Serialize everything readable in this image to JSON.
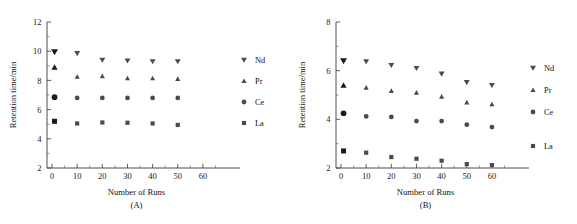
{
  "figure": {
    "background": "#ffffff",
    "marker_color": "#4b4b4b",
    "axis_color": "#3a3a3a"
  },
  "chart_data": [
    {
      "type": "scatter",
      "panel_label": "(A)",
      "title": "",
      "xlabel": "Number of Runs",
      "ylabel": "Retention time/min",
      "xlim": [
        -2,
        66
      ],
      "ylim": [
        2,
        12
      ],
      "xticks": [
        0,
        10,
        20,
        30,
        40,
        50,
        60
      ],
      "yticks": [
        2,
        4,
        6,
        8,
        10,
        12
      ],
      "xtick_labels": [
        "0",
        "10",
        "20",
        "30",
        "40",
        "50",
        "60"
      ],
      "ytick_labels": [
        "2",
        "4",
        "6",
        "8",
        "10",
        "12"
      ],
      "grid": false,
      "legend_position": "right",
      "x": [
        1,
        10,
        20,
        30,
        40,
        50
      ],
      "series": [
        {
          "name": "Nd",
          "marker": "triangle-down",
          "values": [
            9.95,
            9.85,
            9.4,
            9.35,
            9.3,
            9.3
          ]
        },
        {
          "name": "Pr",
          "marker": "triangle-up",
          "values": [
            8.9,
            8.25,
            8.3,
            8.15,
            8.15,
            8.1
          ]
        },
        {
          "name": "Ce",
          "marker": "circle",
          "values": [
            6.85,
            6.8,
            6.8,
            6.8,
            6.8,
            6.8
          ]
        },
        {
          "name": "La",
          "marker": "square",
          "values": [
            5.2,
            5.05,
            5.12,
            5.1,
            5.05,
            4.95
          ]
        }
      ]
    },
    {
      "type": "scatter",
      "panel_label": "(B)",
      "title": "",
      "xlabel": "Number of Runs",
      "ylabel": "Retention time/min",
      "xlim": [
        -2,
        66
      ],
      "ylim": [
        2,
        8
      ],
      "xticks": [
        0,
        10,
        20,
        30,
        40,
        50,
        60
      ],
      "yticks": [
        2,
        4,
        6,
        8
      ],
      "xtick_labels": [
        "0",
        "10",
        "20",
        "30",
        "40",
        "50",
        "60"
      ],
      "ytick_labels": [
        "2",
        "4",
        "6",
        "8"
      ],
      "grid": false,
      "legend_position": "right",
      "x": [
        1,
        10,
        20,
        30,
        40,
        50,
        60
      ],
      "series": [
        {
          "name": "Nd",
          "marker": "triangle-down",
          "values": [
            6.4,
            6.37,
            6.22,
            6.1,
            5.87,
            5.52,
            5.4
          ]
        },
        {
          "name": "Pr",
          "marker": "triangle-up",
          "values": [
            5.4,
            5.3,
            5.17,
            5.1,
            4.93,
            4.7,
            4.62
          ]
        },
        {
          "name": "Ce",
          "marker": "circle",
          "values": [
            4.25,
            4.12,
            4.1,
            3.93,
            3.93,
            3.78,
            3.68
          ]
        },
        {
          "name": "La",
          "marker": "square",
          "values": [
            2.7,
            2.63,
            2.45,
            2.38,
            2.3,
            2.16,
            2.12
          ]
        }
      ]
    }
  ],
  "panels": [
    {
      "caption": "(A)",
      "xlabel": "Number of Runs",
      "ylabel": "Retention time/min",
      "legend": [
        {
          "label": "Nd",
          "marker": "triangle-down"
        },
        {
          "label": "Pr",
          "marker": "triangle-up"
        },
        {
          "label": "Ce",
          "marker": "circle"
        },
        {
          "label": "La",
          "marker": "square"
        }
      ]
    },
    {
      "caption": "(B)",
      "xlabel": "Number of Runs",
      "ylabel": "Retention time/min",
      "legend": [
        {
          "label": "Nd",
          "marker": "triangle-down"
        },
        {
          "label": "Pr",
          "marker": "triangle-up"
        },
        {
          "label": "Ce",
          "marker": "circle"
        },
        {
          "label": "La",
          "marker": "square"
        }
      ]
    }
  ]
}
